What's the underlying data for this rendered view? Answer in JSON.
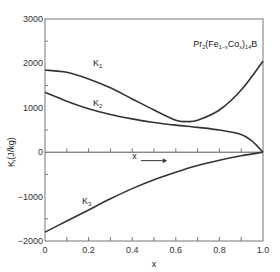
{
  "chart_data": {
    "type": "line",
    "title": "",
    "annotation": "Pr2(Fe1-xCox)14B",
    "xlabel": "x",
    "ylabel": "Ki(J/kg)",
    "xlim": [
      0,
      1.0
    ],
    "ylim": [
      -2000,
      3000
    ],
    "x_ticks": [
      "0",
      "0.2",
      "0.4",
      "0.6",
      "0.8",
      "1.0"
    ],
    "y_ticks": [
      "-2000",
      "-1000",
      "0",
      "1000",
      "2000",
      "3000"
    ],
    "arrow_label": "x",
    "grid": false,
    "series": [
      {
        "name": "K1",
        "x": [
          0,
          0.1,
          0.2,
          0.3,
          0.4,
          0.5,
          0.6,
          0.65,
          0.7,
          0.8,
          0.9,
          1.0
        ],
        "values": [
          1850,
          1800,
          1650,
          1450,
          1200,
          950,
          720,
          690,
          720,
          950,
          1400,
          2050
        ]
      },
      {
        "name": "K2",
        "x": [
          0,
          0.1,
          0.2,
          0.3,
          0.4,
          0.5,
          0.6,
          0.7,
          0.8,
          0.9,
          0.95,
          1.0
        ],
        "values": [
          1350,
          1150,
          980,
          850,
          750,
          670,
          610,
          560,
          500,
          400,
          250,
          0
        ]
      },
      {
        "name": "K3",
        "x": [
          0,
          0.1,
          0.2,
          0.3,
          0.4,
          0.5,
          0.6,
          0.7,
          0.8,
          0.9,
          1.0
        ],
        "values": [
          -1800,
          -1550,
          -1300,
          -1050,
          -820,
          -620,
          -450,
          -300,
          -180,
          -80,
          0
        ]
      }
    ]
  }
}
